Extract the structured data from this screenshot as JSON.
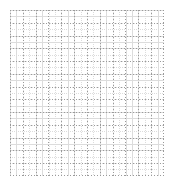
{
  "figure": {
    "title": "",
    "subtitle": "",
    "background_color": "#ffffff",
    "width_px": 173,
    "height_px": 184
  },
  "panel": {
    "name": "empty-plot-grid",
    "left_px": 10,
    "top_px": 10,
    "width_px": 154,
    "height_px": 166,
    "background_color": "#ffffff",
    "border_style": "dotted",
    "border_color": "#9a9a9a"
  },
  "gridlines": {
    "major": {
      "color": "#9a9a9a",
      "style": "dotted",
      "x_spacing_px": 12.83,
      "y_spacing_px": 12.77,
      "x_count": 13,
      "y_count": 14
    },
    "minor": {
      "color": "#dcdcdc",
      "style": "dotted",
      "x_spacing_px": 6.42,
      "y_spacing_px": 6.38,
      "visible": true
    }
  },
  "axes": {
    "x_label": "",
    "y_label": "",
    "x_tick_labels": [],
    "y_tick_labels": [],
    "ticks_visible": false
  },
  "legend": {
    "visible": false,
    "entries": []
  },
  "chart_data": {
    "type": "scatter",
    "title": "",
    "xlabel": "",
    "ylabel": "",
    "x": [],
    "y": [],
    "series": [],
    "categories": [],
    "values": [],
    "xlim": [
      0,
      12
    ],
    "ylim": [
      0,
      13
    ],
    "grid": true,
    "grid_style": "dotted",
    "legend_position": "none",
    "annotations": [],
    "note": "Empty graph-paper panel: dotted major and minor gridlines only, no plotted data, no tick labels, no title."
  }
}
